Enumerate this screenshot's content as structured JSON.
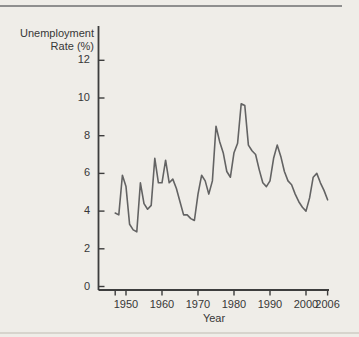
{
  "page": {
    "background_color": "#efede8",
    "top_rule_color": "#8f8f8f",
    "bottom_rule_color": "#d7d4cd",
    "axis_color": "#3d3d3d",
    "line_color": "#636363",
    "text_color": "#373737"
  },
  "chart_data": {
    "type": "line",
    "title": "",
    "ylabel_lines": [
      "Unemployment",
      "Rate (%)"
    ],
    "ylabel": "Unemployment Rate (%)",
    "xlabel": "Year",
    "series_name": "Unemployment rate",
    "x": [
      1947,
      1948,
      1949,
      1950,
      1951,
      1952,
      1953,
      1954,
      1955,
      1956,
      1957,
      1958,
      1959,
      1960,
      1961,
      1962,
      1963,
      1964,
      1965,
      1966,
      1967,
      1968,
      1969,
      1970,
      1971,
      1972,
      1973,
      1974,
      1975,
      1976,
      1977,
      1978,
      1979,
      1980,
      1981,
      1982,
      1983,
      1984,
      1985,
      1986,
      1987,
      1988,
      1989,
      1990,
      1991,
      1992,
      1993,
      1994,
      1995,
      1996,
      1997,
      1998,
      1999,
      2000,
      2001,
      2002,
      2003,
      2004,
      2005,
      2006
    ],
    "values": [
      3.9,
      3.8,
      5.9,
      5.3,
      3.3,
      3.0,
      2.9,
      5.5,
      4.4,
      4.1,
      4.3,
      6.8,
      5.5,
      5.5,
      6.7,
      5.5,
      5.7,
      5.2,
      4.5,
      3.8,
      3.8,
      3.6,
      3.5,
      4.9,
      5.9,
      5.6,
      4.9,
      5.6,
      8.5,
      7.7,
      7.1,
      6.1,
      5.8,
      7.1,
      7.6,
      9.7,
      9.6,
      7.5,
      7.2,
      7.0,
      6.2,
      5.5,
      5.3,
      5.6,
      6.8,
      7.5,
      6.9,
      6.1,
      5.6,
      5.4,
      4.9,
      4.5,
      4.2,
      4.0,
      4.7,
      5.8,
      6.0,
      5.5,
      5.1,
      4.6
    ],
    "y_tick_values": [
      0,
      2,
      4,
      6,
      8,
      10,
      12
    ],
    "y_tick_labels": [
      "0",
      "2",
      "4",
      "6",
      "8",
      "10",
      "12"
    ],
    "x_tick_values": [
      1950,
      1960,
      1970,
      1980,
      1990,
      2000,
      2006
    ],
    "x_tick_labels": [
      "1950",
      "1960",
      "1970",
      "1980",
      "1990",
      "2000",
      "2006"
    ],
    "x_minor_ticks": [
      1947
    ],
    "ylim": [
      0,
      13
    ],
    "xlim": [
      1942,
      2007
    ],
    "grid": false,
    "legend": "none"
  }
}
